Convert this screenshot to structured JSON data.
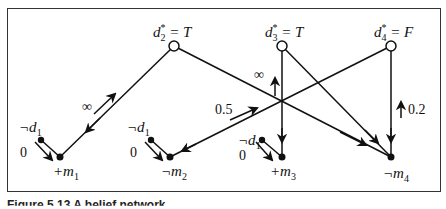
{
  "figure": {
    "caption": "Figure 5.13   A belief network",
    "nodes": {
      "d2": {
        "label_main": "d",
        "label_sub": "2",
        "label_sup": "*",
        "label_rest": " = T"
      },
      "d3": {
        "label_main": "d",
        "label_sub": "3",
        "label_sup": "*",
        "label_rest": " = T"
      },
      "d4": {
        "label_main": "d",
        "label_sub": "4",
        "label_sup": "*",
        "label_rest": " = F"
      },
      "m1": {
        "label_prefix": "+m",
        "label_sub": "1"
      },
      "m2": {
        "label_prefix": "¬m",
        "label_sub": "2"
      },
      "m3": {
        "label_prefix": "+m",
        "label_sub": "3"
      },
      "m4": {
        "label_prefix": "¬m",
        "label_sub": "4"
      },
      "neg_d1": {
        "label_prefix": "¬d",
        "label_sub": "1"
      }
    },
    "edge_labels": {
      "m1_zero": "0",
      "m2_zero": "0",
      "m3_zero": "0",
      "d2_m1": "∞",
      "d3_m3": "∞",
      "d4_m2": "0.5",
      "d4_m4": "0.2"
    }
  }
}
